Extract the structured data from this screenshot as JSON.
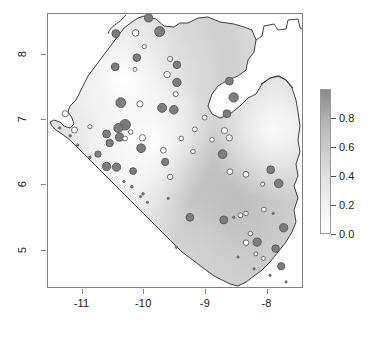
{
  "figure": {
    "type": "map-plot",
    "background": "#ffffff",
    "frame_color": "#828282"
  },
  "axes": {
    "x": {
      "ticks": [
        {
          "label": "-11",
          "value": -11,
          "px": 75
        },
        {
          "label": "-10",
          "value": -10,
          "px": 139
        },
        {
          "label": "-9",
          "value": -9,
          "px": 202
        },
        {
          "label": "-8",
          "value": -8,
          "px": 265
        }
      ],
      "range": [
        -11.56,
        -7.41
      ]
    },
    "y": {
      "ticks": [
        {
          "label": "8",
          "value": 8,
          "px": 61
        },
        {
          "label": "7",
          "value": 7,
          "px": 124
        },
        {
          "label": "6",
          "value": 6,
          "px": 187
        },
        {
          "label": "5",
          "value": 5,
          "px": 250
        }
      ],
      "range": [
        4.41,
        8.63
      ]
    }
  },
  "colorbar": {
    "orientation": "vertical",
    "min": 0.0,
    "max": 1.0,
    "low_color": "#ffffff",
    "high_color": "#8a8a8a",
    "ticks": [
      {
        "label": "0.8",
        "value": 0.8
      },
      {
        "label": "0.6",
        "value": 0.6
      },
      {
        "label": "0.4",
        "value": 0.4
      },
      {
        "label": "0.2",
        "value": 0.2
      },
      {
        "label": "0.0",
        "value": 0.0
      }
    ]
  },
  "chart_data": {
    "type": "scatter",
    "title": "",
    "xlabel": "",
    "ylabel": "",
    "xlim": [
      -11.56,
      -7.41
    ],
    "ylim": [
      4.41,
      8.63
    ],
    "grid": false,
    "legend": "colorbar-right",
    "raster": {
      "description": "greyscale interpolated surface clipped to country polygon",
      "value_range": [
        0.0,
        1.0
      ],
      "colormap": "white-to-grey"
    },
    "point_encoding": {
      "fill_filled": "#7d7d7d",
      "fill_open": "#ffffff",
      "stroke": "#4f4f4f",
      "size_meaning": "magnitude",
      "fill_meaning": "filled = above threshold, open = below threshold"
    },
    "points": [
      {
        "x": -9.93,
        "y": 8.57,
        "r": 4.1,
        "filled": true
      },
      {
        "x": -10.46,
        "y": 8.33,
        "r": 4.0,
        "filled": true
      },
      {
        "x": -10.14,
        "y": 8.34,
        "r": 3.3,
        "filled": false
      },
      {
        "x": -9.75,
        "y": 8.36,
        "r": 5.0,
        "filled": true
      },
      {
        "x": -10.0,
        "y": 8.13,
        "r": 2.1,
        "filled": false
      },
      {
        "x": -10.12,
        "y": 7.96,
        "r": 3.8,
        "filled": true
      },
      {
        "x": -9.58,
        "y": 7.94,
        "r": 2.6,
        "filled": false
      },
      {
        "x": -9.47,
        "y": 7.85,
        "r": 3.8,
        "filled": true
      },
      {
        "x": -10.47,
        "y": 7.82,
        "r": 3.9,
        "filled": true
      },
      {
        "x": -10.15,
        "y": 7.78,
        "r": 2.0,
        "filled": false
      },
      {
        "x": -9.63,
        "y": 7.7,
        "r": 3.2,
        "filled": false
      },
      {
        "x": -9.47,
        "y": 7.58,
        "r": 4.2,
        "filled": true
      },
      {
        "x": -8.62,
        "y": 7.6,
        "r": 3.9,
        "filled": true
      },
      {
        "x": -9.49,
        "y": 7.4,
        "r": 2.5,
        "filled": false
      },
      {
        "x": -8.55,
        "y": 7.35,
        "r": 4.7,
        "filled": true
      },
      {
        "x": -10.38,
        "y": 7.27,
        "r": 4.9,
        "filled": true
      },
      {
        "x": -10.07,
        "y": 7.25,
        "r": 3.1,
        "filled": false
      },
      {
        "x": -9.71,
        "y": 7.19,
        "r": 4.5,
        "filled": true
      },
      {
        "x": -9.52,
        "y": 7.16,
        "r": 4.3,
        "filled": true
      },
      {
        "x": -8.66,
        "y": 7.1,
        "r": 3.9,
        "filled": true
      },
      {
        "x": -11.28,
        "y": 7.1,
        "r": 3.1,
        "filled": false
      },
      {
        "x": -9.02,
        "y": 7.04,
        "r": 2.4,
        "filled": false
      },
      {
        "x": -10.31,
        "y": 6.93,
        "r": 5.3,
        "filled": true
      },
      {
        "x": -10.42,
        "y": 6.88,
        "r": 4.5,
        "filled": true
      },
      {
        "x": -10.88,
        "y": 6.9,
        "r": 2.1,
        "filled": false
      },
      {
        "x": -11.13,
        "y": 6.85,
        "r": 3.0,
        "filled": false
      },
      {
        "x": -8.7,
        "y": 6.84,
        "r": 3.1,
        "filled": false
      },
      {
        "x": -10.22,
        "y": 6.82,
        "r": 2.3,
        "filled": false
      },
      {
        "x": -9.18,
        "y": 6.86,
        "r": 2.4,
        "filled": false
      },
      {
        "x": -10.61,
        "y": 6.79,
        "r": 3.9,
        "filled": true
      },
      {
        "x": -10.4,
        "y": 6.74,
        "r": 4.1,
        "filled": true
      },
      {
        "x": -10.31,
        "y": 6.72,
        "r": 2.4,
        "filled": false
      },
      {
        "x": -10.03,
        "y": 6.73,
        "r": 3.2,
        "filled": false
      },
      {
        "x": -9.4,
        "y": 6.72,
        "r": 2.3,
        "filled": false
      },
      {
        "x": -8.9,
        "y": 6.7,
        "r": 2.3,
        "filled": false
      },
      {
        "x": -8.62,
        "y": 6.73,
        "r": 3.1,
        "filled": false
      },
      {
        "x": -10.56,
        "y": 6.65,
        "r": 3.7,
        "filled": true
      },
      {
        "x": -10.05,
        "y": 6.57,
        "r": 4.4,
        "filled": true
      },
      {
        "x": -9.69,
        "y": 6.54,
        "r": 2.9,
        "filled": false
      },
      {
        "x": -9.21,
        "y": 6.52,
        "r": 2.3,
        "filled": false
      },
      {
        "x": -10.75,
        "y": 6.48,
        "r": 3.2,
        "filled": true
      },
      {
        "x": -8.73,
        "y": 6.48,
        "r": 4.4,
        "filled": true
      },
      {
        "x": -9.66,
        "y": 6.36,
        "r": 3.6,
        "filled": true
      },
      {
        "x": -10.61,
        "y": 6.29,
        "r": 4.2,
        "filled": true
      },
      {
        "x": -10.45,
        "y": 6.28,
        "r": 4.2,
        "filled": true
      },
      {
        "x": -10.18,
        "y": 6.22,
        "r": 3.4,
        "filled": true
      },
      {
        "x": -7.95,
        "y": 6.24,
        "r": 3.9,
        "filled": true
      },
      {
        "x": -8.61,
        "y": 6.21,
        "r": 2.9,
        "filled": false
      },
      {
        "x": -8.35,
        "y": 6.17,
        "r": 2.9,
        "filled": false
      },
      {
        "x": -9.58,
        "y": 6.13,
        "r": 2.7,
        "filled": false
      },
      {
        "x": -7.82,
        "y": 6.03,
        "r": 4.3,
        "filled": true
      },
      {
        "x": -8.08,
        "y": 6.02,
        "r": 2.1,
        "filled": false
      },
      {
        "x": -10.2,
        "y": 5.98,
        "r": 1.4,
        "filled": true
      },
      {
        "x": -10.06,
        "y": 5.83,
        "r": 1.2,
        "filled": true
      },
      {
        "x": -9.61,
        "y": 5.8,
        "r": 1.2,
        "filled": true
      },
      {
        "x": -9.95,
        "y": 5.74,
        "r": 1.2,
        "filled": true
      },
      {
        "x": -8.06,
        "y": 5.63,
        "r": 2.3,
        "filled": false
      },
      {
        "x": -8.35,
        "y": 5.57,
        "r": 2.2,
        "filled": false
      },
      {
        "x": -7.91,
        "y": 5.57,
        "r": 1.2,
        "filled": true
      },
      {
        "x": -9.26,
        "y": 5.51,
        "r": 3.9,
        "filled": true
      },
      {
        "x": -8.71,
        "y": 5.47,
        "r": 4.0,
        "filled": true
      },
      {
        "x": -8.44,
        "y": 5.54,
        "r": 2.4,
        "filled": false
      },
      {
        "x": -8.55,
        "y": 5.51,
        "r": 1.2,
        "filled": true
      },
      {
        "x": -7.74,
        "y": 5.35,
        "r": 4.1,
        "filled": true
      },
      {
        "x": -8.28,
        "y": 5.26,
        "r": 2.3,
        "filled": false
      },
      {
        "x": -8.17,
        "y": 5.13,
        "r": 4.1,
        "filled": true
      },
      {
        "x": -8.35,
        "y": 5.12,
        "r": 2.8,
        "filled": false
      },
      {
        "x": -7.87,
        "y": 5.03,
        "r": 3.8,
        "filled": true
      },
      {
        "x": -8.19,
        "y": 4.95,
        "r": 2.0,
        "filled": false
      },
      {
        "x": -9.48,
        "y": 5.05,
        "r": 1.2,
        "filled": true
      },
      {
        "x": -8.48,
        "y": 4.9,
        "r": 1.2,
        "filled": true
      },
      {
        "x": -8.07,
        "y": 4.88,
        "r": 2.0,
        "filled": false
      },
      {
        "x": -7.78,
        "y": 4.76,
        "r": 3.6,
        "filled": true
      },
      {
        "x": -8.22,
        "y": 4.72,
        "r": 1.2,
        "filled": true
      },
      {
        "x": -7.96,
        "y": 4.62,
        "r": 1.2,
        "filled": true
      },
      {
        "x": -7.7,
        "y": 4.52,
        "r": 1.2,
        "filled": true
      },
      {
        "x": -11.37,
        "y": 6.88,
        "r": 1.3,
        "filled": true
      },
      {
        "x": -11.2,
        "y": 6.76,
        "r": 1.3,
        "filled": true
      },
      {
        "x": -11.08,
        "y": 6.62,
        "r": 1.3,
        "filled": true
      },
      {
        "x": -10.88,
        "y": 6.43,
        "r": 1.3,
        "filled": true
      },
      {
        "x": -10.33,
        "y": 6.06,
        "r": 1.3,
        "filled": true
      },
      {
        "x": -10.02,
        "y": 5.87,
        "r": 1.3,
        "filled": true
      }
    ]
  }
}
